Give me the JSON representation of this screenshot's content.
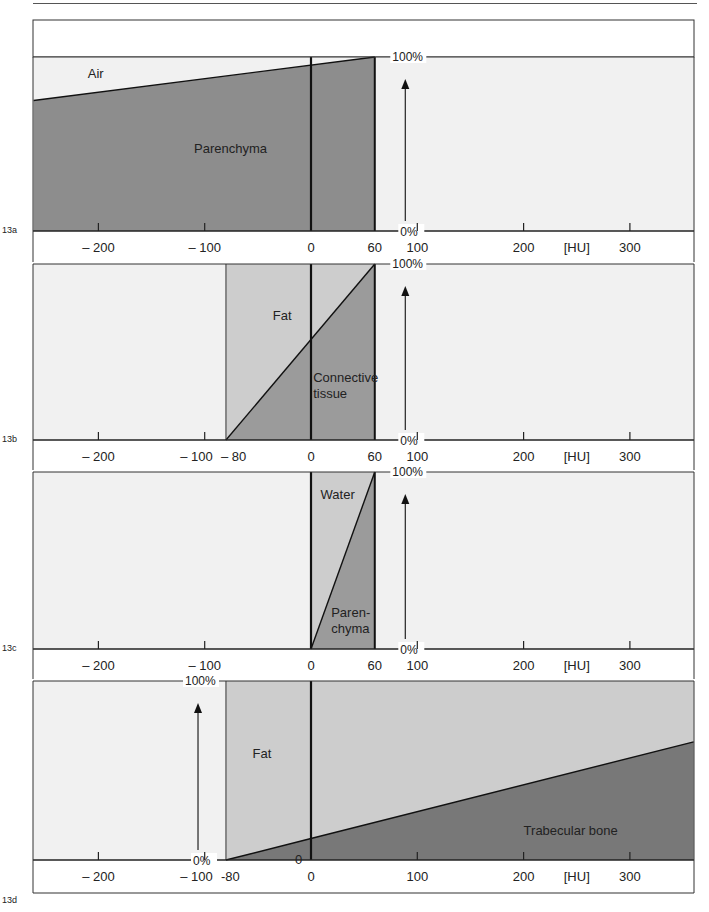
{
  "chart_data": {
    "type": "area",
    "title": "",
    "xlabel": "[HU]",
    "ylabel": "",
    "xlim": [
      -261,
      360
    ],
    "ylim": [
      0,
      100
    ],
    "y_tick_labels": [
      "0%",
      "100%"
    ],
    "x_unit_label": "[HU]",
    "colors": {
      "panel_background": "#f1f1f1",
      "light_fill": "#cdcdcd",
      "medium_fill": "#9b9b9b",
      "dark_fill": "#8d8d8d",
      "bone_fill": "#787878",
      "line": "#111111"
    },
    "panels": [
      {
        "id": "13a",
        "x_tick_labels": [
          {
            "value": -200,
            "label": "– 200"
          },
          {
            "value": -100,
            "label": "– 100"
          },
          {
            "value": 0,
            "label": "0"
          },
          {
            "value": 60,
            "label": "60"
          },
          {
            "value": 100,
            "label": "100"
          },
          {
            "value": 200,
            "label": "200"
          },
          {
            "value": 300,
            "label": "300"
          }
        ],
        "region": [
          -261,
          60
        ],
        "boundary": [
          {
            "x": -261,
            "y": 75
          },
          {
            "x": 60,
            "y": 100
          }
        ],
        "upper": {
          "name": "Air",
          "fill": "none"
        },
        "lower": {
          "name": "Parenchyma",
          "fill": "dark"
        },
        "labels": [
          {
            "text": "Air",
            "x": -210,
            "y": 88
          },
          {
            "text": "Parenchyma",
            "x": -110,
            "y": 45
          }
        ],
        "y_axis_at": 100,
        "left_edge_line": false
      },
      {
        "id": "13b",
        "x_tick_labels": [
          {
            "value": -200,
            "label": "– 200"
          },
          {
            "value": -100,
            "label": "– 100"
          },
          {
            "value": -80,
            "label": "– 80"
          },
          {
            "value": 0,
            "label": "0"
          },
          {
            "value": 60,
            "label": "60"
          },
          {
            "value": 100,
            "label": "100"
          },
          {
            "value": 200,
            "label": "200"
          },
          {
            "value": 300,
            "label": "300"
          }
        ],
        "region": [
          -80,
          60
        ],
        "boundary": [
          {
            "x": -80,
            "y": 0
          },
          {
            "x": 60,
            "y": 100
          }
        ],
        "upper": {
          "name": "Fat",
          "fill": "light"
        },
        "lower": {
          "name": "Connective tissue",
          "fill": "medium"
        },
        "labels": [
          {
            "text": "Fat",
            "x": -36,
            "y": 68
          },
          {
            "text": "Connective",
            "x": 2,
            "y": 33
          },
          {
            "text": "tissue",
            "x": 2,
            "y": 24
          }
        ],
        "y_axis_at": 100,
        "left_edge_line": true
      },
      {
        "id": "13c",
        "x_tick_labels": [
          {
            "value": -200,
            "label": "– 200"
          },
          {
            "value": -100,
            "label": "– 100"
          },
          {
            "value": 0,
            "label": "0"
          },
          {
            "value": 60,
            "label": "60"
          },
          {
            "value": 100,
            "label": "100"
          },
          {
            "value": 200,
            "label": "200"
          },
          {
            "value": 300,
            "label": "300"
          }
        ],
        "region": [
          0,
          60
        ],
        "boundary": [
          {
            "x": 0,
            "y": 0
          },
          {
            "x": 60,
            "y": 100
          }
        ],
        "upper": {
          "name": "Water",
          "fill": "light"
        },
        "lower": {
          "name": "Parenchyma",
          "fill": "medium"
        },
        "labels": [
          {
            "text": "Water",
            "x": 9,
            "y": 85
          },
          {
            "text": "Paren-",
            "x": 19,
            "y": 18
          },
          {
            "text": "chyma",
            "x": 19,
            "y": 9
          }
        ],
        "y_axis_at": 100,
        "left_edge_line": true
      },
      {
        "id": "13d",
        "x_tick_labels": [
          {
            "value": -200,
            "label": "– 200"
          },
          {
            "value": -100,
            "label": "– 100"
          },
          {
            "value": -80,
            "label": "-80"
          },
          {
            "value": 0,
            "label": "0"
          },
          {
            "value": 100,
            "label": "100"
          },
          {
            "value": 200,
            "label": "200"
          },
          {
            "value": 300,
            "label": "300"
          }
        ],
        "region": [
          -80,
          360
        ],
        "boundary": [
          {
            "x": -80,
            "y": 0
          },
          {
            "x": 0,
            "y": 12
          },
          {
            "x": 360,
            "y": 66
          }
        ],
        "upper": {
          "name": "Fat",
          "fill": "light"
        },
        "lower": {
          "name": "Trabecular bone",
          "fill": "bone"
        },
        "labels": [
          {
            "text": "Fat",
            "x": -55,
            "y": 57
          },
          {
            "text": "Trabecular bone",
            "x": 200,
            "y": 14
          }
        ],
        "extra_zero_label": {
          "text": "0",
          "x": -15,
          "y": 0
        },
        "y_axis_at": -95,
        "left_edge_line": true
      }
    ]
  }
}
